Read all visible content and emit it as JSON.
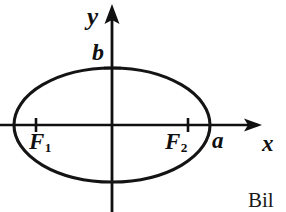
{
  "figure": {
    "kind": "ellipse-with-foci-diagram",
    "background_color": "#ffffff",
    "ink_color": "#101010",
    "width": 286,
    "height": 212
  },
  "axes": {
    "origin": {
      "x": 112,
      "y": 125
    },
    "x_axis": {
      "label": "x",
      "start_x": 0,
      "end_x": 262,
      "y": 125,
      "arrow": "right"
    },
    "y_axis": {
      "label": "y",
      "x": 112,
      "start_y": 5,
      "end_y": 212,
      "arrow": "up"
    }
  },
  "ellipse": {
    "center_x": 112,
    "center_y": 125,
    "semi_major_a": 98,
    "semi_minor_b": 57,
    "stroke_width": 3
  },
  "labels": {
    "y_axis": "y",
    "x_axis": "x",
    "semi_minor": "b",
    "semi_major": "a",
    "focus_left": "F",
    "focus_left_sub": "1",
    "focus_right": "F",
    "focus_right_sub": "2"
  },
  "tick_marks": [
    {
      "name": "focus-left-tick",
      "x": 36,
      "y": 125,
      "orientation": "vertical",
      "length": 14
    },
    {
      "name": "focus-right-tick",
      "x": 188,
      "y": 125,
      "orientation": "vertical",
      "length": 14
    },
    {
      "name": "semi-minor-tick",
      "x": 112,
      "y": 68,
      "orientation": "horizontal",
      "length": 16
    }
  ],
  "caption": {
    "fragment": "Bil"
  }
}
